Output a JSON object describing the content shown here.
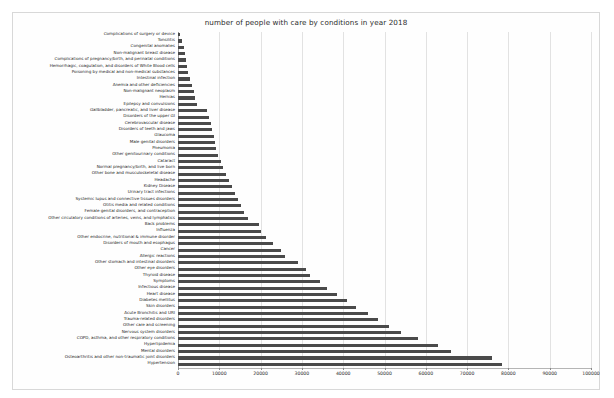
{
  "chart_data": {
    "type": "bar",
    "orientation": "horizontal",
    "title": "number of people with care by conditions in year 2018",
    "xlabel": "",
    "ylabel": "",
    "xlim": [
      0,
      100000
    ],
    "xticks": [
      0,
      10000,
      20000,
      30000,
      40000,
      50000,
      60000,
      70000,
      80000,
      90000,
      100000
    ],
    "xtick_labels": [
      "0",
      "10000",
      "20000",
      "30000",
      "40000",
      "50000",
      "60000",
      "70000",
      "80000",
      "90000",
      "100000"
    ],
    "grid": true,
    "legend": null,
    "bar_color": "#4a4a4a",
    "categories": [
      "Complications of surgery or device",
      "Tonsilitis",
      "Congenital anomalies",
      "Non-malignant breast disease",
      "Complications of pregnancy/birth, and perinatal conditions",
      "Hemorrhagic, coagulation, and disorders of White Blood cells",
      "Poisoning by medical and non-medical substances",
      "Intestinal infection",
      "Anemia and other deficiencies",
      "Non-malignant neoplasm",
      "Hernias",
      "Epilepsy and convulsions",
      "Gallbladder, pancreatic, and liver disease",
      "Disorders of the upper GI",
      "Cerebrovascular disease",
      "Disorders of teeth and jaws",
      "Glaucoma",
      "Male genital disorders",
      "Pneumonia",
      "Other genitourinary conditions",
      "Cataract",
      "Normal pregnancy/birth, and live born",
      "Other bone and musculoskeletal disease",
      "Headache",
      "Kidney Disease",
      "Urinary tract infections",
      "Systemic lupus and connective tissues disorders",
      "Otitis media and related conditions",
      "Female genital disorders, and contraception",
      "Other circulatory conditions of arteries, veins, and lymphatics",
      "Back problems",
      "Influenza",
      "Other endocrine, nutritional & immune disorder",
      "Disorders of mouth and esophagus",
      "Cancer",
      "Allergic reactions",
      "Other stomach and intestinal disorders",
      "Other eye disorders",
      "Thyroid disease",
      "Symptoms",
      "Infectious disease",
      "Heart disease",
      "Diabetes mellitus",
      "Skin disorders",
      "Acute Bronchitis and URI",
      "Trauma-related disorders",
      "Other care and screening",
      "Nervous system disorders",
      "COPD, asthma, and other respiratory conditions",
      "Hyperlipidemia",
      "Mental disorders",
      "Osteoarthritis and other non-traumatic joint disorders",
      "Hypertension"
    ],
    "values": [
      600,
      900,
      1500,
      1600,
      1900,
      2200,
      2500,
      3000,
      3400,
      3800,
      4200,
      4700,
      7000,
      7600,
      8000,
      8300,
      8700,
      9000,
      9300,
      9700,
      10500,
      11000,
      11600,
      12300,
      13000,
      13700,
      14600,
      15300,
      16000,
      17000,
      19500,
      20200,
      21300,
      23000,
      25000,
      26000,
      29000,
      31000,
      32000,
      34500,
      36000,
      38500,
      41000,
      43000,
      46000,
      48500,
      51000,
      54000,
      58000,
      63000,
      66000,
      76000,
      78500
    ]
  }
}
